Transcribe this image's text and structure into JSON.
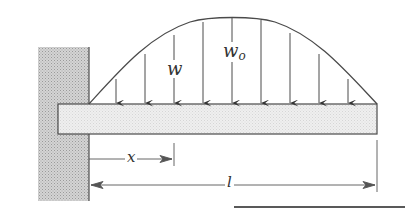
{
  "diagram": {
    "colors": {
      "line": "#4a4a4a",
      "wall_fill": "#c8c8c8",
      "beam_fill": "#ececec",
      "background": "#ffffff"
    },
    "labels": {
      "load_local": "w",
      "load_max_base": "w",
      "load_max_sub": "o",
      "position": "x",
      "length": "l"
    },
    "components": {
      "wall": "fixed-support-wall",
      "beam": "cantilever-beam",
      "load": "sinusoidal-distributed-load",
      "load_arrow_count": 9
    }
  }
}
